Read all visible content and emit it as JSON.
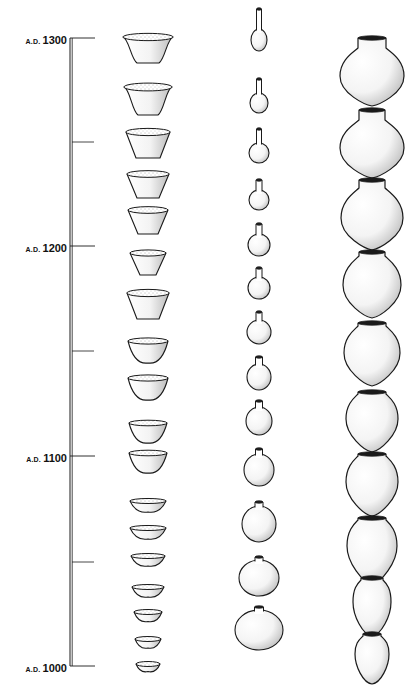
{
  "diagram": {
    "type": "ceramic-seriation-timeline",
    "colors": {
      "ink": "#1a1a1a",
      "stipple": "#555555",
      "background": "#ffffff"
    },
    "timeline": {
      "x": 71,
      "top": 38,
      "bottom": 666,
      "labels": [
        {
          "era": "A.D.",
          "year": "1300",
          "y": 38
        },
        {
          "era": "A.D.",
          "year": "1200",
          "y": 246
        },
        {
          "era": "A.D.",
          "year": "1100",
          "y": 456
        },
        {
          "era": "A.D.",
          "year": "1000",
          "y": 666
        }
      ],
      "minor_ticks": [
        142,
        351,
        562
      ]
    },
    "columns": [
      {
        "name": "bowls",
        "cx": 148,
        "items": [
          {
            "y": 50,
            "w": 50,
            "h": 26,
            "shape": "bowl-flared"
          },
          {
            "y": 101,
            "w": 48,
            "h": 28,
            "shape": "bowl-flared"
          },
          {
            "y": 145,
            "w": 44,
            "h": 26,
            "shape": "bowl-conical"
          },
          {
            "y": 186,
            "w": 42,
            "h": 24,
            "shape": "bowl-conical"
          },
          {
            "y": 222,
            "w": 40,
            "h": 24,
            "shape": "bowl-conical"
          },
          {
            "y": 264,
            "w": 36,
            "h": 22,
            "shape": "bowl-conical"
          },
          {
            "y": 306,
            "w": 42,
            "h": 26,
            "shape": "bowl-conical"
          },
          {
            "y": 352,
            "w": 40,
            "h": 22,
            "shape": "bowl-rounded"
          },
          {
            "y": 389,
            "w": 40,
            "h": 22,
            "shape": "bowl-rounded"
          },
          {
            "y": 433,
            "w": 38,
            "h": 20,
            "shape": "bowl-rounded"
          },
          {
            "y": 463,
            "w": 38,
            "h": 20,
            "shape": "bowl-rounded"
          },
          {
            "y": 503,
            "w": 36,
            "h": 18,
            "shape": "bowl-shallow"
          },
          {
            "y": 530,
            "w": 36,
            "h": 18,
            "shape": "bowl-shallow"
          },
          {
            "y": 558,
            "w": 34,
            "h": 16,
            "shape": "bowl-shallow"
          },
          {
            "y": 589,
            "w": 32,
            "h": 16,
            "shape": "bowl-shallow"
          },
          {
            "y": 614,
            "w": 28,
            "h": 15,
            "shape": "bowl-shallow"
          },
          {
            "y": 641,
            "w": 26,
            "h": 14,
            "shape": "bowl-shallow"
          },
          {
            "y": 666,
            "w": 24,
            "h": 11,
            "shape": "bowl-shallow"
          }
        ]
      },
      {
        "name": "bottles",
        "cx": 259,
        "items": [
          {
            "y": 40,
            "neck_h": 22,
            "neck_w": 5,
            "body_rx": 8,
            "body_ry": 11
          },
          {
            "y": 103,
            "neck_h": 16,
            "neck_w": 5,
            "body_rx": 9,
            "body_ry": 10
          },
          {
            "y": 153,
            "neck_h": 16,
            "neck_w": 5,
            "body_rx": 10,
            "body_ry": 10
          },
          {
            "y": 200,
            "neck_h": 12,
            "neck_w": 6,
            "body_rx": 10,
            "body_ry": 10
          },
          {
            "y": 245,
            "neck_h": 12,
            "neck_w": 6,
            "body_rx": 11,
            "body_ry": 11
          },
          {
            "y": 288,
            "neck_h": 11,
            "neck_w": 6,
            "body_rx": 11,
            "body_ry": 11
          },
          {
            "y": 332,
            "neck_h": 10,
            "neck_w": 6,
            "body_rx": 12,
            "body_ry": 12
          },
          {
            "y": 377,
            "neck_h": 9,
            "neck_w": 7,
            "body_rx": 12,
            "body_ry": 13
          },
          {
            "y": 421,
            "neck_h": 8,
            "neck_w": 7,
            "body_rx": 13,
            "body_ry": 14
          },
          {
            "y": 470,
            "neck_h": 7,
            "neck_w": 7,
            "body_rx": 15,
            "body_ry": 16
          },
          {
            "y": 524,
            "neck_h": 6,
            "neck_w": 8,
            "body_rx": 17,
            "body_ry": 18
          },
          {
            "y": 578,
            "neck_h": 5,
            "neck_w": 8,
            "body_rx": 20,
            "body_ry": 18
          },
          {
            "y": 630,
            "neck_h": 5,
            "neck_w": 9,
            "body_rx": 24,
            "body_ry": 20
          }
        ]
      },
      {
        "name": "jars",
        "cx": 372,
        "items": [
          {
            "y": 38,
            "rim_w": 28,
            "neck_h": 10,
            "body_rx": 32,
            "body_ry": 30,
            "point": 0
          },
          {
            "y": 110,
            "rim_w": 26,
            "neck_h": 10,
            "body_rx": 32,
            "body_ry": 30,
            "point": 0
          },
          {
            "y": 180,
            "rim_w": 26,
            "neck_h": 8,
            "body_rx": 31,
            "body_ry": 32,
            "point": 0
          },
          {
            "y": 252,
            "rim_w": 26,
            "neck_h": 4,
            "body_rx": 29,
            "body_ry": 31,
            "point": 2
          },
          {
            "y": 323,
            "rim_w": 28,
            "neck_h": 3,
            "body_rx": 28,
            "body_ry": 29,
            "point": 4
          },
          {
            "y": 392,
            "rim_w": 28,
            "neck_h": 2,
            "body_rx": 26,
            "body_ry": 27,
            "point": 6
          },
          {
            "y": 454,
            "rim_w": 28,
            "neck_h": 2,
            "body_rx": 26,
            "body_ry": 28,
            "point": 6
          },
          {
            "y": 518,
            "rim_w": 28,
            "neck_h": 2,
            "body_rx": 25,
            "body_ry": 28,
            "point": 10
          },
          {
            "y": 578,
            "rim_w": 22,
            "neck_h": 2,
            "body_rx": 19,
            "body_ry": 24,
            "point": 10
          },
          {
            "y": 634,
            "rim_w": 18,
            "neck_h": 2,
            "body_rx": 17,
            "body_ry": 20,
            "point": 10
          }
        ]
      }
    ]
  }
}
